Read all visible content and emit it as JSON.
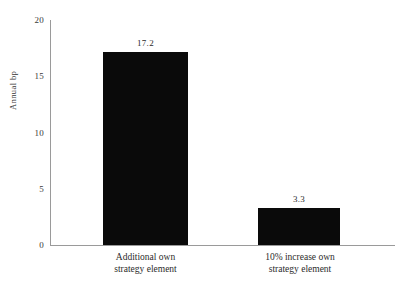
{
  "chart_data": {
    "type": "bar",
    "title": "",
    "subtitle": "",
    "xlabel": "",
    "ylabel": "Annual bp",
    "ylim": [
      0,
      20
    ],
    "yticks": [
      0,
      5,
      10,
      15,
      20
    ],
    "grid": false,
    "legend": false,
    "legend_position": "none",
    "orientation": "vertical",
    "bar_color": "#0a0a0a",
    "axis_color": "#9a9a9a",
    "background_color": "#ffffff",
    "categories": [
      "Additional own strategy element",
      "10% increase own strategy element"
    ],
    "values": [
      17.2,
      3.3
    ],
    "value_labels": [
      "17.2",
      "3.3"
    ],
    "category_lines": [
      {
        "line1": "Additional own",
        "line2": "strategy element"
      },
      {
        "line1": "10%  increase  own",
        "line2": "strategy element"
      }
    ],
    "ytick_labels": [
      "0",
      "5",
      "10",
      "15",
      "20"
    ]
  }
}
